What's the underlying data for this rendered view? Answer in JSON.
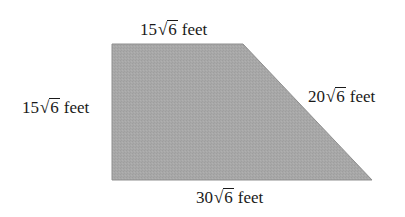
{
  "figure": {
    "shape": "trapezoid",
    "fill_color": "#a8a8a8",
    "edge_color": "#8f8f8f",
    "vertices": {
      "top_left": [
        112,
        44
      ],
      "top_right": [
        243,
        44
      ],
      "bottom_right": [
        372,
        180
      ],
      "bottom_left": [
        112,
        180
      ]
    }
  },
  "labels": {
    "top": {
      "coefficient": "15",
      "radical_symbol": "√",
      "radicand": "6",
      "unit": "feet"
    },
    "left": {
      "coefficient": "15",
      "radical_symbol": "√",
      "radicand": "6",
      "unit": "feet"
    },
    "slant": {
      "coefficient": "20",
      "radical_symbol": "√",
      "radicand": "6",
      "unit": "feet"
    },
    "bottom": {
      "coefficient": "30",
      "radical_symbol": "√",
      "radicand": "6",
      "unit": "feet"
    }
  }
}
